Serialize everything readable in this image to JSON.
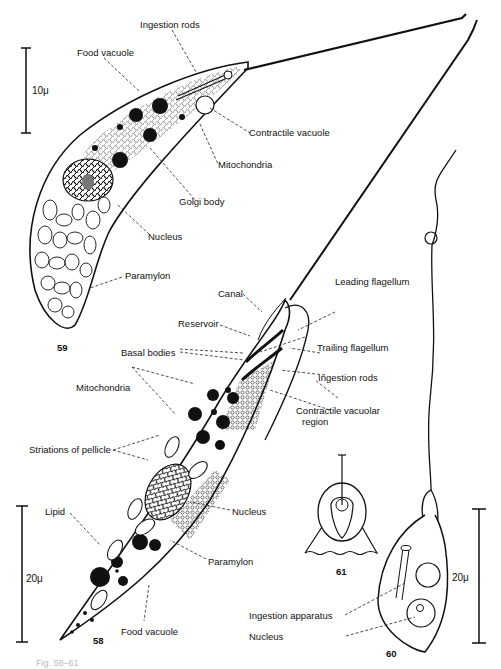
{
  "figure": {
    "numbers": {
      "fig59": "59",
      "fig58": "58",
      "fig60": "60",
      "fig61": "61"
    },
    "scale_bars": {
      "top_left": "10μ",
      "bottom_left": "20μ",
      "right": "20μ"
    },
    "labels_59": {
      "ingestion_rods": "Ingestion rods",
      "food_vacuole": "Food vacuole",
      "contractile_vacuole": "Contractile vacuole",
      "mitochondria": "Mitochondria",
      "golgi_body": "Golgi body",
      "nucleus": "Nucleus",
      "paramylon": "Paramylon"
    },
    "labels_58": {
      "leading_flagellum": "Leading flagellum",
      "canal": "Canal",
      "reservoir": "Reservoir",
      "basal_bodies": "Basal bodies",
      "trailing_flagellum": "Trailing flagellum",
      "ingestion_rods": "Ingestion rods",
      "mitochondria": "Mitochondria",
      "contractile_vacuolar_region_1": "Contractile vacuolar",
      "contractile_vacuolar_region_2": "region",
      "striations_of_pellicle": "Striations of pellicle",
      "nucleus": "Nucleus",
      "lipid": "Lipid",
      "paramylon": "Paramylon",
      "food_vacuole": "Food vacuole"
    },
    "labels_60": {
      "ingestion_apparatus": "Ingestion apparatus",
      "nucleus": "Nucleus"
    },
    "caption_fragment": "Fig. 58–61"
  }
}
